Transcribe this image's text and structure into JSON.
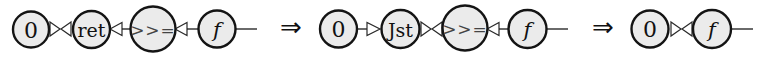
{
  "diagram": {
    "type": "interaction-net-reduction",
    "colors": {
      "node_fill": "#ebebeb",
      "node_stroke": "#141414",
      "wire": "#1a1a1a",
      "port_fill": "#ffffff"
    },
    "stages": [
      {
        "nodes": [
          {
            "id": "s1-zero",
            "label": "0"
          },
          {
            "id": "s1-ret",
            "label": "ret"
          },
          {
            "id": "s1-bind",
            "label": ">>="
          },
          {
            "id": "s1-f",
            "label": "f"
          }
        ],
        "connections": [
          {
            "from": "s1-zero",
            "to": "s1-ret",
            "kind": "bowtie"
          },
          {
            "from": "s1-ret",
            "to": "s1-bind",
            "kind": "port-left"
          },
          {
            "from": "s1-bind",
            "to": "s1-f",
            "kind": "port-left"
          },
          {
            "from": "s1-f",
            "to": "out",
            "kind": "free-wire"
          }
        ]
      },
      {
        "nodes": [
          {
            "id": "s2-zero",
            "label": "0"
          },
          {
            "id": "s2-jst",
            "label": "Jst"
          },
          {
            "id": "s2-bind",
            "label": ">>="
          },
          {
            "id": "s2-f",
            "label": "f"
          }
        ],
        "connections": [
          {
            "from": "s2-zero",
            "to": "s2-jst",
            "kind": "port-right"
          },
          {
            "from": "s2-jst",
            "to": "s2-bind",
            "kind": "bowtie"
          },
          {
            "from": "s2-bind",
            "to": "s2-f",
            "kind": "port-left"
          },
          {
            "from": "s2-f",
            "to": "out",
            "kind": "free-wire"
          }
        ]
      },
      {
        "nodes": [
          {
            "id": "s3-zero",
            "label": "0"
          },
          {
            "id": "s3-f",
            "label": "f"
          }
        ],
        "connections": [
          {
            "from": "s3-zero",
            "to": "s3-f",
            "kind": "bowtie"
          },
          {
            "from": "s3-f",
            "to": "out",
            "kind": "free-wire"
          }
        ]
      }
    ],
    "transitions": [
      {
        "symbol": "⇒"
      },
      {
        "symbol": "⇒"
      }
    ]
  }
}
